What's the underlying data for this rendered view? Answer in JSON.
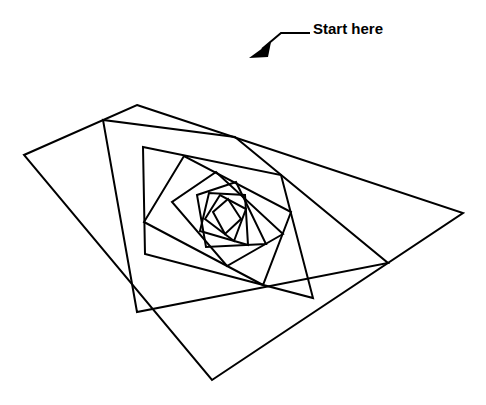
{
  "figure": {
    "background_color": "#ffffff",
    "stroke_color": "#000000",
    "stroke_width": 2,
    "canvas": {
      "width": 486,
      "height": 405
    }
  },
  "annotation": {
    "label": "Start here",
    "label_x": 313,
    "label_y": 20,
    "font_size": 15,
    "font_weight": "bold",
    "color": "#000000",
    "leader_polyline": "262,49 281,33 310,33",
    "arrow_tip_x": 249,
    "arrow_tip_y": 58,
    "arrow_points": "249,58 271,42 268,57"
  },
  "chart_data": {
    "type": "line",
    "xlabel": "",
    "ylabel": "",
    "grid": false,
    "legend": "none",
    "ratio_t": 0.3,
    "levels": 9,
    "convergence_point": [
      235,
      218
    ],
    "outer_quad": [
      [
        137,
        105
      ],
      [
        463,
        213
      ],
      [
        212,
        380
      ],
      [
        24,
        155
      ]
    ],
    "quads": [
      [
        [
          137,
          105
        ],
        [
          463,
          213
        ],
        [
          212,
          380
        ],
        [
          24,
          155
        ]
      ],
      [
        [
          235,
          137
        ],
        [
          388,
          263
        ],
        [
          137,
          312
        ],
        [
          103,
          120
        ]
      ],
      [
        [
          281,
          175
        ],
        [
          313,
          298
        ],
        [
          145,
          254
        ],
        [
          143,
          147
        ]
      ],
      [
        [
          291,
          212
        ],
        [
          263,
          285
        ],
        [
          144,
          222
        ],
        [
          184,
          156
        ]
      ],
      [
        [
          283,
          234
        ],
        [
          227,
          266
        ],
        [
          172,
          202
        ],
        [
          216,
          172
        ]
      ],
      [
        [
          266,
          244
        ],
        [
          206,
          247
        ],
        [
          197,
          195
        ],
        [
          236,
          182
        ]
      ],
      [
        [
          248,
          245
        ],
        [
          200,
          231
        ],
        [
          209,
          193
        ],
        [
          245,
          195
        ]
      ],
      [
        [
          234,
          241
        ],
        [
          205,
          219
        ],
        [
          220,
          195
        ],
        [
          246,
          209
        ]
      ],
      [
        [
          225,
          234
        ],
        [
          213,
          212
        ],
        [
          228,
          199
        ],
        [
          241,
          219
        ]
      ]
    ]
  }
}
